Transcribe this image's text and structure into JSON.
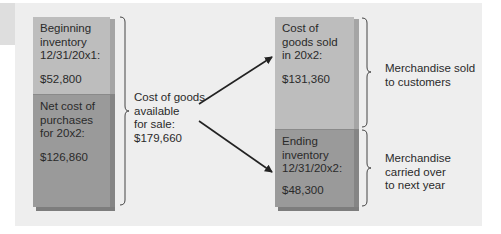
{
  "diagram": {
    "left_box": {
      "top_segment": {
        "label_lines": [
          "Beginning",
          "inventory",
          "12/31/20x1:"
        ],
        "value": "$52,800"
      },
      "bottom_segment": {
        "label_lines": [
          "Net cost of",
          "purchases",
          "for 20x2:"
        ],
        "value": "$126,860"
      }
    },
    "middle_label": {
      "lines": [
        "Cost of goods",
        "available",
        "for sale:",
        "$179,660"
      ]
    },
    "right_box": {
      "top_segment": {
        "label_lines": [
          "Cost of",
          "goods sold",
          "in 20x2:"
        ],
        "value": "$131,360"
      },
      "bottom_segment": {
        "label_lines": [
          "Ending",
          "inventory",
          "12/31/20x2:"
        ],
        "value": "$48,300"
      }
    },
    "right_labels": {
      "top": {
        "lines": [
          "Merchandise sold",
          "to customers"
        ]
      },
      "bottom": {
        "lines": [
          "Merchandise",
          "carried over",
          "to next year"
        ]
      }
    },
    "colors": {
      "panel": "#eeeeee",
      "light_segment": "#bdbdbd",
      "dark_segment": "#9a9a9a",
      "text": "#2a2a2a",
      "arrow": "#222222"
    }
  }
}
